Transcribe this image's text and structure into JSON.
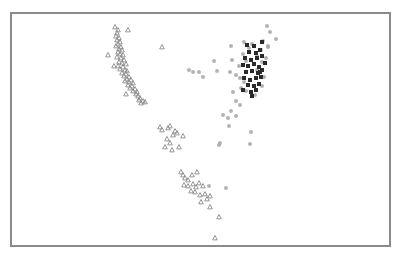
{
  "chart_data": {
    "type": "scatter",
    "title": "",
    "xlabel": "",
    "ylabel": "",
    "grid": false,
    "legend": null,
    "frame": {
      "x": 10,
      "y": 12,
      "width": 379,
      "height": 233,
      "color": "#8a8a8a"
    },
    "coordinate_note": "Points given in image pixel coordinates (no axis ticks are shown).",
    "series": [
      {
        "name": "triangles",
        "marker": "triangle",
        "color": "#8c8c8c",
        "size": 3,
        "points": [
          [
            115,
            27
          ],
          [
            118,
            30
          ],
          [
            117,
            33
          ],
          [
            116,
            36
          ],
          [
            119,
            38
          ],
          [
            117,
            40
          ],
          [
            120,
            42
          ],
          [
            118,
            44
          ],
          [
            116,
            46
          ],
          [
            121,
            47
          ],
          [
            119,
            49
          ],
          [
            122,
            50
          ],
          [
            118,
            52
          ],
          [
            120,
            54
          ],
          [
            123,
            55
          ],
          [
            117,
            57
          ],
          [
            121,
            58
          ],
          [
            124,
            60
          ],
          [
            119,
            62
          ],
          [
            122,
            63
          ],
          [
            126,
            64
          ],
          [
            118,
            66
          ],
          [
            123,
            67
          ],
          [
            120,
            69
          ],
          [
            125,
            70
          ],
          [
            127,
            71
          ],
          [
            122,
            73
          ],
          [
            126,
            74
          ],
          [
            124,
            76
          ],
          [
            129,
            77
          ],
          [
            127,
            79
          ],
          [
            131,
            80
          ],
          [
            125,
            81
          ],
          [
            129,
            82
          ],
          [
            133,
            83
          ],
          [
            128,
            85
          ],
          [
            132,
            86
          ],
          [
            130,
            88
          ],
          [
            135,
            89
          ],
          [
            133,
            91
          ],
          [
            137,
            92
          ],
          [
            136,
            94
          ],
          [
            138,
            96
          ],
          [
            140,
            98
          ],
          [
            139,
            100
          ],
          [
            143,
            101
          ],
          [
            145,
            102
          ],
          [
            141,
            103
          ],
          [
            128,
            30
          ],
          [
            108,
            55
          ],
          [
            114,
            66
          ],
          [
            126,
            94
          ],
          [
            162,
            47
          ],
          [
            160,
            127
          ],
          [
            162,
            130
          ],
          [
            168,
            128
          ],
          [
            170,
            126
          ],
          [
            175,
            131
          ],
          [
            173,
            135
          ],
          [
            177,
            133
          ],
          [
            167,
            139
          ],
          [
            170,
            143
          ],
          [
            165,
            147
          ],
          [
            172,
            150
          ],
          [
            179,
            147
          ],
          [
            183,
            136
          ],
          [
            181,
            172
          ],
          [
            183,
            175
          ],
          [
            185,
            178
          ],
          [
            188,
            180
          ],
          [
            192,
            175
          ],
          [
            197,
            172
          ],
          [
            184,
            185
          ],
          [
            188,
            186
          ],
          [
            193,
            184
          ],
          [
            196,
            187
          ],
          [
            199,
            183
          ],
          [
            203,
            186
          ],
          [
            191,
            191
          ],
          [
            195,
            192
          ],
          [
            200,
            195
          ],
          [
            205,
            194
          ],
          [
            210,
            196
          ],
          [
            207,
            199
          ],
          [
            201,
            202
          ],
          [
            210,
            207
          ],
          [
            219,
            217
          ],
          [
            215,
            238
          ]
        ]
      },
      {
        "name": "light circles",
        "marker": "circle",
        "color": "#a6a6a6",
        "size": 3,
        "points": [
          [
            267,
            26
          ],
          [
            270,
            32
          ],
          [
            276,
            39
          ],
          [
            231,
            46
          ],
          [
            244,
            42
          ],
          [
            263,
            41
          ],
          [
            268,
            46
          ],
          [
            257,
            56
          ],
          [
            246,
            61
          ],
          [
            214,
            61
          ],
          [
            232,
            60
          ],
          [
            217,
            71
          ],
          [
            189,
            70
          ],
          [
            193,
            72
          ],
          [
            199,
            72
          ],
          [
            203,
            77
          ],
          [
            230,
            72
          ],
          [
            236,
            75
          ],
          [
            240,
            78
          ],
          [
            241,
            88
          ],
          [
            233,
            92
          ],
          [
            236,
            101
          ],
          [
            240,
            105
          ],
          [
            231,
            111
          ],
          [
            223,
            115
          ],
          [
            228,
            118
          ],
          [
            236,
            116
          ],
          [
            229,
            126
          ],
          [
            251,
            132
          ],
          [
            250,
            144
          ],
          [
            219,
            145
          ],
          [
            220,
            143
          ],
          [
            226,
            188
          ],
          [
            209,
            186
          ],
          [
            268,
            47
          ],
          [
            266,
            58
          ],
          [
            257,
            70
          ],
          [
            264,
            77
          ],
          [
            243,
            54
          ],
          [
            249,
            48
          ],
          [
            252,
            44
          ],
          [
            262,
            62
          ],
          [
            239,
            66
          ],
          [
            244,
            82
          ],
          [
            262,
            86
          ],
          [
            255,
            95
          ],
          [
            246,
            91
          ],
          [
            261,
            50
          ]
        ]
      },
      {
        "name": "dark squares",
        "marker": "square",
        "color": "#2a2a2a",
        "size": 4,
        "points": [
          [
            247,
            45
          ],
          [
            254,
            46
          ],
          [
            262,
            42
          ],
          [
            249,
            52
          ],
          [
            256,
            53
          ],
          [
            260,
            50
          ],
          [
            245,
            58
          ],
          [
            251,
            60
          ],
          [
            257,
            58
          ],
          [
            262,
            56
          ],
          [
            243,
            65
          ],
          [
            248,
            66
          ],
          [
            254,
            64
          ],
          [
            259,
            67
          ],
          [
            246,
            72
          ],
          [
            252,
            71
          ],
          [
            258,
            73
          ],
          [
            262,
            70
          ],
          [
            244,
            78
          ],
          [
            250,
            80
          ],
          [
            256,
            78
          ],
          [
            261,
            77
          ],
          [
            248,
            85
          ],
          [
            254,
            86
          ],
          [
            259,
            84
          ],
          [
            243,
            90
          ],
          [
            251,
            92
          ],
          [
            256,
            90
          ],
          [
            252,
            96
          ],
          [
            260,
            72
          ],
          [
            265,
            63
          ]
        ]
      }
    ]
  }
}
